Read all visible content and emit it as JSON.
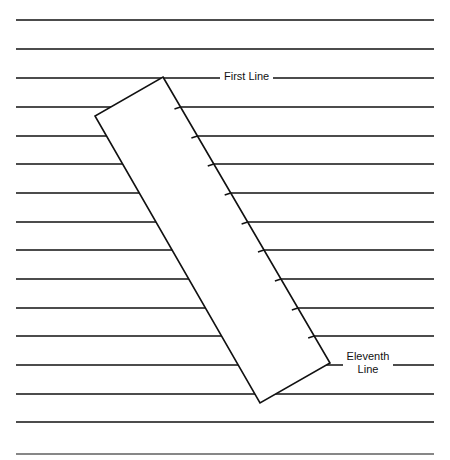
{
  "diagram": {
    "labels": {
      "first_line": "First Line",
      "eleventh_line": "Eleventh Line"
    },
    "lines": {
      "count": 16,
      "x_start": 16,
      "x_end": 434,
      "y_positions": [
        20,
        49,
        78,
        107,
        136,
        164,
        193,
        222,
        250,
        279,
        308,
        336,
        365,
        394,
        422,
        454
      ],
      "color": "#111111"
    },
    "ruler": {
      "corners": {
        "top": [
          163,
          77
        ],
        "left": [
          95,
          116
        ],
        "bottom": [
          260,
          403
        ],
        "right": [
          330,
          363
        ]
      },
      "tick_count": 10,
      "fill": "#ffffff",
      "stroke": "#111111"
    }
  }
}
